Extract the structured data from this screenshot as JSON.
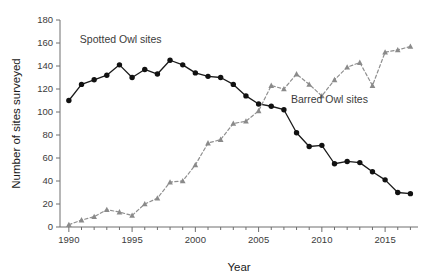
{
  "chart_data": {
    "type": "line",
    "title": "",
    "xlabel": "Year",
    "ylabel": "Number of sites surveyed",
    "xlim": [
      1989.3,
      2017.6
    ],
    "ylim": [
      0,
      180
    ],
    "ytick_step": 20,
    "yticks": [
      0,
      20,
      40,
      60,
      80,
      100,
      120,
      140,
      160,
      180
    ],
    "xticks": [
      1990,
      1995,
      2000,
      2005,
      2010,
      2015
    ],
    "xtick_labels": [
      "1990",
      "1995",
      "2000",
      "2005",
      "2010",
      "2015"
    ],
    "ytick_labels": [
      "0",
      "20",
      "40",
      "60",
      "80",
      "100",
      "120",
      "140",
      "160",
      "180"
    ],
    "minor_xticks": [
      1991,
      1992,
      1993,
      1994,
      1996,
      1997,
      1998,
      1999,
      2001,
      2002,
      2003,
      2004,
      2006,
      2007,
      2008,
      2009,
      2011,
      2012,
      2013,
      2014,
      2016,
      2017
    ],
    "grid": false,
    "legend_position": "inline-annotations",
    "x": [
      1990,
      1991,
      1992,
      1993,
      1994,
      1995,
      1996,
      1997,
      1998,
      1999,
      2000,
      2001,
      2002,
      2003,
      2004,
      2005,
      2006,
      2007,
      2008,
      2009,
      2010,
      2011,
      2012,
      2013,
      2014,
      2015,
      2016,
      2017
    ],
    "series": [
      {
        "name": "Spotted Owl sites",
        "marker": "circle",
        "linestyle": "solid",
        "color": "#111111",
        "values": [
          110,
          124,
          128,
          132,
          141,
          130,
          137,
          133,
          145,
          141,
          134,
          131,
          130,
          124,
          114,
          107,
          105,
          102,
          82,
          70,
          71,
          55,
          57,
          56,
          48,
          41,
          30,
          29
        ]
      },
      {
        "name": "Barred Owl sites",
        "marker": "triangle",
        "linestyle": "dashed",
        "color": "#8a8a8a",
        "values": [
          2,
          6,
          9,
          15,
          13,
          10,
          20,
          25,
          39,
          40,
          54,
          73,
          76,
          90,
          92,
          101,
          123,
          120,
          133,
          124,
          114,
          128,
          139,
          143,
          123,
          152,
          154,
          157
        ]
      }
    ],
    "annotations": [
      {
        "text": "Spotted Owl sites",
        "x": 1994.1,
        "y": 160,
        "color": "#3b3b3b"
      },
      {
        "text": "Barred Owl sites",
        "x": 2010.6,
        "y": 108,
        "color": "#3b3b3b"
      }
    ]
  }
}
